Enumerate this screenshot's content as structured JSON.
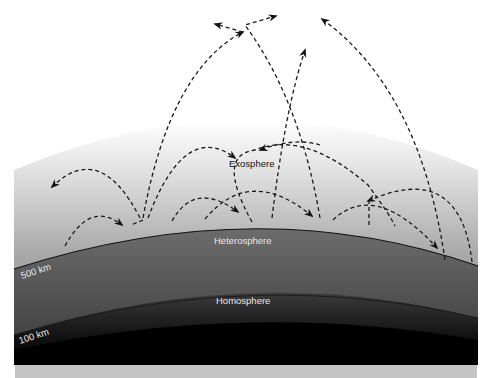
{
  "diagram": {
    "layers": [
      {
        "name": "Exosphere",
        "label": "Exosphere"
      },
      {
        "name": "Heterosphere",
        "label": "Heterosphere"
      },
      {
        "name": "Homosphere",
        "label": "Homosphere"
      }
    ],
    "boundaries": [
      {
        "altitude_label": "500 km"
      },
      {
        "altitude_label": "100 km"
      }
    ],
    "colors": {
      "background": "#ffffff",
      "exosphere_top": "#f2f2f2",
      "exosphere_bottom": "#8a8a8a",
      "heterosphere": "#5a5a5a",
      "homosphere": "#262626",
      "ground": "#000000",
      "footer_bar": "#c4c4c4",
      "trajectory": "#1a1a1a"
    }
  }
}
